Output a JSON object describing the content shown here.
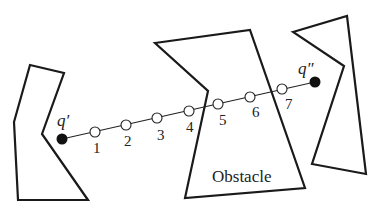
{
  "diagram": {
    "obstacles": [
      {
        "name": "left-obstacle",
        "points": "30,65 64,73 42,134 88,200 18,200 14,122"
      },
      {
        "name": "center-obstacle",
        "label": "Obstacle",
        "points": "155,43 250,30 305,188 185,198 208,91"
      },
      {
        "name": "right-obstacle",
        "points": "293,32 347,16 366,174 312,164 344,66"
      }
    ],
    "start": {
      "label": "q′",
      "x": 62,
      "y": 139
    },
    "goal": {
      "label": "q″",
      "x": 315,
      "y": 82
    },
    "samples": [
      {
        "label": "1",
        "x": 95,
        "y": 132
      },
      {
        "label": "2",
        "x": 126,
        "y": 125
      },
      {
        "label": "3",
        "x": 157,
        "y": 118
      },
      {
        "label": "4",
        "x": 189,
        "y": 111
      },
      {
        "label": "5",
        "x": 218,
        "y": 104
      },
      {
        "label": "6",
        "x": 250,
        "y": 97
      },
      {
        "label": "7",
        "x": 282,
        "y": 89
      }
    ],
    "obstacle_label": "Obstacle"
  }
}
